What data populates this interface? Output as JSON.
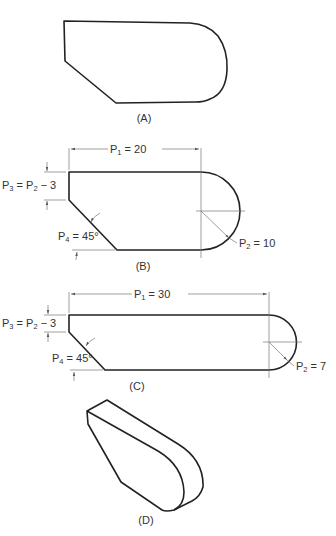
{
  "figure": {
    "panels": [
      {
        "id": "A",
        "caption": "(A)",
        "description": "Outline sketch of profile shape"
      },
      {
        "id": "B",
        "caption": "(B)",
        "parameters": {
          "p1": {
            "sym": "P",
            "sub": "1",
            "rest": " = 20"
          },
          "p2": {
            "sym": "P",
            "sub": "2",
            "rest": " = 10"
          },
          "p3_lhs": {
            "sym": "P",
            "sub": "3"
          },
          "p3_rhs": {
            "sym": "P",
            "sub": "2",
            "rest": " − 3"
          },
          "p4": {
            "sym": "P",
            "sub": "4",
            "rest": " = 45°"
          }
        }
      },
      {
        "id": "C",
        "caption": "(C)",
        "parameters": {
          "p1": {
            "sym": "P",
            "sub": "1",
            "rest": " = 30"
          },
          "p2": {
            "sym": "P",
            "sub": "2",
            "rest": " = 7"
          },
          "p3_lhs": {
            "sym": "P",
            "sub": "3"
          },
          "p3_rhs": {
            "sym": "P",
            "sub": "2",
            "rest": " − 3"
          },
          "p4": {
            "sym": "P",
            "sub": "4",
            "rest": " = 45°"
          }
        }
      },
      {
        "id": "D",
        "caption": "(D)",
        "description": "Isometric extruded solid"
      }
    ],
    "eq": " = "
  }
}
